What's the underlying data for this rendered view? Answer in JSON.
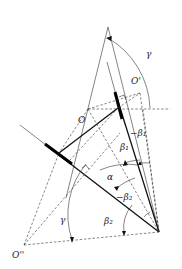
{
  "diagram": {
    "type": "geometric-kinematic-diagram",
    "points": {
      "O": {
        "label": "O"
      },
      "O_prime": {
        "label": "O'"
      },
      "O_double_prime": {
        "label": "O''"
      }
    },
    "angles": {
      "gamma_top": {
        "label": "γ"
      },
      "gamma_bottom": {
        "label": "γ"
      },
      "alpha": {
        "label": "α"
      },
      "beta1": {
        "label": "β₁"
      },
      "neg_beta1": {
        "label": "−β₁"
      },
      "beta2": {
        "label": "β₂"
      },
      "neg_beta2": {
        "label": "−β₂"
      }
    }
  }
}
